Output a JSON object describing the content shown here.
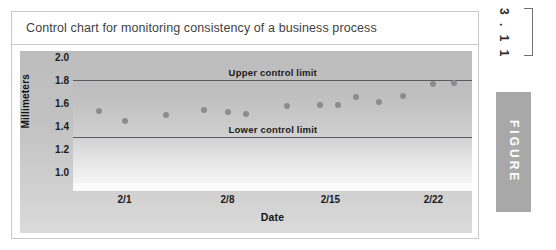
{
  "figure": {
    "title": "Control chart for monitoring consistency of a business process",
    "number": "3 . 1 1",
    "word": "FIGURE",
    "marker_color": "#a8a8a8"
  },
  "chart_data": {
    "type": "scatter",
    "title": "Control chart for monitoring consistency of a business process",
    "xlabel": "Date",
    "ylabel": "Millimeters",
    "ylim": [
      0.9,
      2.05
    ],
    "yticks": [
      "1.0",
      "1.2",
      "1.4",
      "1.6",
      "1.8",
      "2.0"
    ],
    "ytick_values": [
      1.0,
      1.2,
      1.4,
      1.6,
      1.8,
      2.0
    ],
    "xticks": [
      "2/1",
      "2/8",
      "2/15",
      "2/22"
    ],
    "xtick_positions": [
      2,
      6,
      10,
      14
    ],
    "xlim": [
      0,
      15.5
    ],
    "grid": false,
    "legend": "none",
    "point_color": "#8c8c8c",
    "limit_line_color": "#5a5a63",
    "series": [
      {
        "name": "Measurement",
        "x": [
          1,
          2,
          3.6,
          5.1,
          6.0,
          6.7,
          8.3,
          9.6,
          10.3,
          11.0,
          11.9,
          12.8,
          14.0,
          14.8
        ],
        "values": [
          1.53,
          1.44,
          1.49,
          1.54,
          1.52,
          1.5,
          1.57,
          1.58,
          1.58,
          1.65,
          1.61,
          1.66,
          1.76,
          1.77
        ]
      }
    ],
    "reference_lines": [
      {
        "label": "Upper control limit",
        "value": 1.8
      },
      {
        "label": "Lower control limit",
        "value": 1.3
      }
    ]
  }
}
